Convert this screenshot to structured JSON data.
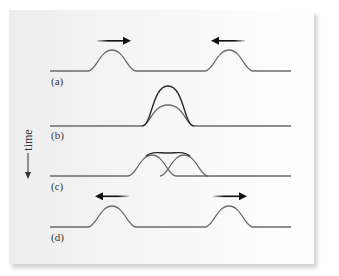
{
  "figure": {
    "time_axis_label": "time",
    "rows": [
      {
        "label": "(a)",
        "description": "Two pulses approaching each other",
        "arrows": [
          "right",
          "left"
        ]
      },
      {
        "label": "(b)",
        "description": "Pulses fully overlapping, resultant amplitude doubled"
      },
      {
        "label": "(c)",
        "description": "Pulses partially overlapping with summed envelope"
      },
      {
        "label": "(d)",
        "description": "Two pulses moving apart after passing through each other",
        "arrows": [
          "left",
          "right"
        ]
      }
    ]
  },
  "colors": {
    "pulse_line": "#6b6b6b",
    "resultant_line": "#2a2a2a",
    "arrow": "#111111",
    "text": "#333333"
  }
}
